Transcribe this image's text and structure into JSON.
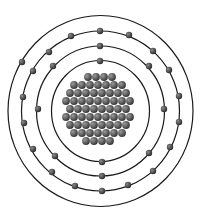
{
  "diagram": {
    "type": "bohr-atom-model",
    "shell_counts": [
      2,
      8,
      18,
      1
    ],
    "total_electrons": 29,
    "nucleus_particle_count": 64,
    "colors": {
      "background": "#ffffff",
      "orbit_stroke": "#1a1a1a",
      "electron_fill": "#3c3c3c",
      "electron_highlight": "#8a8a8a",
      "nucleus_fill": "#4e4e4e",
      "nucleus_highlight": "#9a9a9a"
    },
    "center": {
      "x": 100.5,
      "y": 111
    },
    "shells": [
      {
        "name": "shell-1",
        "rx": 49,
        "ry": 50.5,
        "electrons": [
          [
            100,
            61
          ],
          [
            102,
            162
          ]
        ]
      },
      {
        "name": "shell-2",
        "rx": 64,
        "ry": 65,
        "electrons": [
          [
            100,
            46
          ],
          [
            53,
            66
          ],
          [
            149,
            66
          ],
          [
            38,
            109
          ],
          [
            164,
            109
          ],
          [
            55,
            156
          ],
          [
            149,
            153
          ],
          [
            102,
            176
          ]
        ]
      },
      {
        "name": "shell-3",
        "rx": 79,
        "ry": 80,
        "electrons": [
          [
            100,
            31
          ],
          [
            71,
            36
          ],
          [
            129,
            35
          ],
          [
            49,
            52
          ],
          [
            153,
            51
          ],
          [
            33,
            71
          ],
          [
            169,
            70
          ],
          [
            23,
            97
          ],
          [
            179,
            96
          ],
          [
            24,
            123
          ],
          [
            179,
            122
          ],
          [
            33,
            149
          ],
          [
            170,
            147
          ],
          [
            52,
            172
          ],
          [
            153,
            171
          ],
          [
            75,
            186
          ],
          [
            128,
            185
          ],
          [
            102,
            191
          ]
        ]
      },
      {
        "name": "shell-4",
        "rx": 92.5,
        "ry": 95.5,
        "electrons": [
          [
            22,
            62
          ]
        ]
      }
    ],
    "nucleus_rows": [
      {
        "y": 77,
        "xs": [
          88,
          96,
          104,
          112
        ]
      },
      {
        "y": 85,
        "xs": [
          74,
          82,
          90,
          98,
          106,
          114,
          122
        ]
      },
      {
        "y": 93,
        "xs": [
          70,
          78,
          86,
          94,
          102,
          110,
          118,
          126
        ]
      },
      {
        "y": 101,
        "xs": [
          66,
          74,
          82,
          90,
          98,
          106,
          114,
          122,
          130
        ]
      },
      {
        "y": 109,
        "xs": [
          70,
          78,
          86,
          94,
          102,
          110,
          118,
          126
        ]
      },
      {
        "y": 117,
        "xs": [
          66,
          74,
          82,
          90,
          98,
          106,
          114,
          122,
          130
        ]
      },
      {
        "y": 125,
        "xs": [
          70,
          78,
          86,
          94,
          102,
          110,
          118,
          126
        ]
      },
      {
        "y": 133,
        "xs": [
          74,
          82,
          90,
          98,
          106,
          114,
          122
        ]
      },
      {
        "y": 141,
        "xs": [
          86,
          94,
          102,
          110
        ]
      }
    ]
  }
}
